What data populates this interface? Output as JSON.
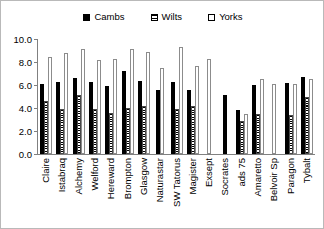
{
  "legend": {
    "position": "top-center",
    "entries": [
      {
        "label": "Cambs",
        "key": "cambs",
        "swatch": "filled-black-square-icon"
      },
      {
        "label": "Wilts",
        "key": "wilts",
        "swatch": "hatched-square-icon"
      },
      {
        "label": "Yorks",
        "key": "yorks",
        "swatch": "open-white-square-icon"
      }
    ]
  },
  "axis": {
    "y_tick_labels": [
      "10.0",
      "8.0",
      "6.0",
      "4.0",
      "2.0",
      "0.0"
    ],
    "y_tick_values": [
      10.0,
      8.0,
      6.0,
      4.0,
      2.0,
      0.0
    ]
  },
  "colors": {
    "cambs": "#000000",
    "wilts": "#8c8c8c",
    "yorks": "#ffffff",
    "axis": "#808080",
    "border": "#b9b9b9",
    "text": "#000000"
  },
  "chart_data": {
    "type": "bar",
    "title": "",
    "subtitle": "",
    "xlabel": "",
    "ylabel": "",
    "ylim": [
      0.0,
      10.0
    ],
    "ytick_step": 2.0,
    "grid": false,
    "legend_position": "top-center",
    "categories": [
      "Claire",
      "Istabraq",
      "Alchemy",
      "Welford",
      "Hereward",
      "Brompton",
      "Glasgow",
      "Naturastar",
      "SW Tatorus",
      "Magister",
      "Exsept",
      "Socrates",
      "ads 75",
      "Amaretto",
      "Belvoir Sp",
      "Paragon",
      "Tybalt"
    ],
    "series": [
      {
        "name": "Cambs",
        "values": [
          6.1,
          6.3,
          6.6,
          6.3,
          5.9,
          7.2,
          6.35,
          5.55,
          6.25,
          5.55,
          0,
          5.1,
          3.8,
          6.0,
          0,
          6.2,
          6.7
        ]
      },
      {
        "name": "Wilts",
        "values": [
          4.65,
          3.9,
          5.15,
          3.9,
          3.6,
          4.0,
          4.2,
          0,
          3.95,
          4.2,
          0,
          0,
          2.9,
          3.5,
          0,
          3.4,
          4.95
        ]
      },
      {
        "name": "Yorks",
        "values": [
          8.45,
          8.75,
          9.1,
          8.2,
          8.3,
          9.15,
          8.85,
          7.5,
          9.3,
          7.65,
          8.3,
          0,
          3.5,
          6.5,
          6.1,
          6.1,
          6.5
        ]
      }
    ]
  }
}
